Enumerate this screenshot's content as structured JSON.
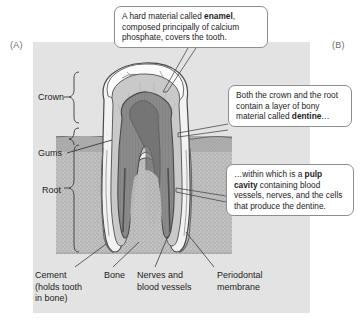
{
  "figure": {
    "panel_a_label": "(A)",
    "panel_b_label": "(B)"
  },
  "callouts": [
    {
      "id": "enamel",
      "text_before": "A hard material called ",
      "term": "enamel",
      "text_after": ", composed principally of calcium phosphate, covers the tooth."
    },
    {
      "id": "dentine",
      "text_before": "Both the crown and the root contain a layer of bony material called ",
      "term": "dentine",
      "text_after": "…"
    },
    {
      "id": "pulp",
      "text_before": "…within which is a ",
      "term": "pulp cavity",
      "text_after": " containing blood vessels, nerves, and the cells that produce the dentine."
    }
  ],
  "labels": {
    "crown": "Crown",
    "gums": "Gums",
    "root": "Root",
    "cement": "Cement\n(holds tooth\nin bone)",
    "bone": "Bone",
    "nerves": "Nerves and\nblood vessels",
    "periodontal": "Periodontal\nmembrane"
  },
  "colors": {
    "panel_background": "#e3e3e3",
    "callout_border": "#8d8d8d",
    "enamel": "#f4f4f4",
    "dentine": "#c8c8c8",
    "pulp": "#8e8e8e",
    "bone": "#b9b9b9",
    "gum": "#a9a9a9",
    "outline": "#4a4a4a",
    "text": "#1c1c1c"
  },
  "diagram": {
    "structures": [
      "enamel",
      "dentine",
      "pulp cavity",
      "cement",
      "bone",
      "nerves and blood vessels",
      "periodontal membrane",
      "gums"
    ]
  }
}
